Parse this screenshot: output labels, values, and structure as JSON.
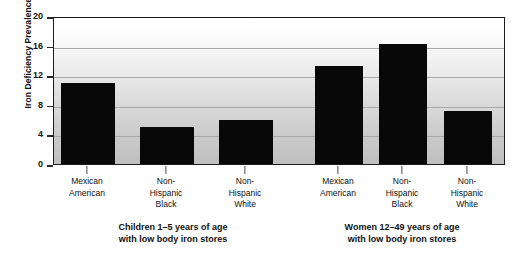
{
  "chart_data": {
    "type": "bar",
    "title": "",
    "subtitle": "",
    "xlabel": "",
    "ylabel": "Iron Deficiency Prevalence (%)",
    "ylim": [
      0,
      20
    ],
    "yticks": [
      0,
      4,
      8,
      12,
      16,
      20
    ],
    "ytick_labels": [
      "0",
      "4",
      "8",
      "12",
      "16",
      "20"
    ],
    "grid": true,
    "legend": "none",
    "categories": [
      "Mexican American",
      "Non-Hispanic Black",
      "Non-Hispanic White",
      "Mexican American",
      "Non-Hispanic Black",
      "Non-Hispanic White"
    ],
    "values": [
      11.0,
      5.0,
      6.0,
      13.2,
      16.2,
      7.2
    ],
    "bar_color": "#080808",
    "groups": [
      {
        "caption_lines": [
          "Children 1–5 years of age",
          "with low body iron stores"
        ],
        "bars": [
          {
            "label_lines": [
              "Mexican",
              "American"
            ],
            "value": 11.0
          },
          {
            "label_lines": [
              "Non-",
              "Hispanic",
              "Black"
            ],
            "value": 5.0
          },
          {
            "label_lines": [
              "Non-",
              "Hispanic",
              "White"
            ],
            "value": 6.0
          }
        ]
      },
      {
        "caption_lines": [
          "Women 12–49 years of age",
          "with low body iron stores"
        ],
        "bars": [
          {
            "label_lines": [
              "Mexican",
              "American"
            ],
            "value": 13.2
          },
          {
            "label_lines": [
              "Non-",
              "Hispanic",
              "Black"
            ],
            "value": 16.2
          },
          {
            "label_lines": [
              "Non-",
              "Hispanic",
              "White"
            ],
            "value": 7.2
          }
        ]
      }
    ]
  },
  "axis": {
    "y_title": "Iron Deficiency Prevalence (%)",
    "tick_0": "0",
    "tick_4": "4",
    "tick_8": "8",
    "tick_12": "12",
    "tick_16": "16",
    "tick_20": "20"
  },
  "xlabels": {
    "b0": {
      "l0": "Mexican",
      "l1": "American",
      "l2": ""
    },
    "b1": {
      "l0": "Non-",
      "l1": "Hispanic",
      "l2": "Black"
    },
    "b2": {
      "l0": "Non-",
      "l1": "Hispanic",
      "l2": "White"
    },
    "b3": {
      "l0": "Mexican",
      "l1": "American",
      "l2": ""
    },
    "b4": {
      "l0": "Non-",
      "l1": "Hispanic",
      "l2": "Black"
    },
    "b5": {
      "l0": "Non-",
      "l1": "Hispanic",
      "l2": "White"
    }
  },
  "captions": {
    "left_line1": "Children 1–5 years of age",
    "left_line2": "with low body iron stores",
    "right_line1": "Women 12–49 years of age",
    "right_line2": "with low body iron stores"
  },
  "colors": {
    "bar": "#080808",
    "frame": "#1c1c1c",
    "gridline": "#a9a9a9",
    "text": "#111111"
  }
}
